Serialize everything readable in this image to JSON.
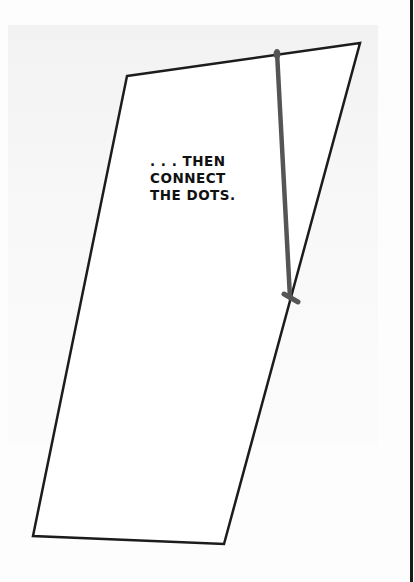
{
  "panel": {
    "caption_lines": [
      ". . . THEN",
      "CONNECT",
      "THE DOTS."
    ],
    "colors": {
      "outline": "#1c1c1c",
      "connector_stroke": "#555555",
      "border": "#1a1a1a",
      "background": "#fdfdfd"
    },
    "shape": {
      "type": "parallelogram",
      "vertices": [
        [
          127,
          76
        ],
        [
          360,
          43
        ],
        [
          224,
          544
        ],
        [
          33,
          536
        ]
      ]
    },
    "connector_line": {
      "from": [
        276,
        50
      ],
      "to": [
        290,
        298
      ]
    }
  }
}
